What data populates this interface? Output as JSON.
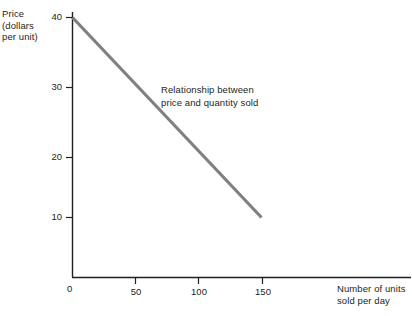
{
  "chart_data": {
    "type": "line",
    "title": "",
    "xlabel": "Number of units\nsold per day",
    "ylabel": "Price\n(dollars\nper unit)",
    "xlim": [
      0,
      180
    ],
    "ylim": [
      0,
      43
    ],
    "grid": false,
    "legend": "none",
    "annotations": [
      {
        "text": "Relationship between\nprice and quantity sold",
        "x": 95,
        "y": 29
      }
    ],
    "xticks": [
      0,
      50,
      100,
      150
    ],
    "xtick_labels": [
      "0",
      "50",
      "100",
      "150"
    ],
    "yticks": [
      10,
      20,
      30,
      40
    ],
    "ytick_labels": [
      "10",
      "20",
      "30",
      "40"
    ],
    "origin_label": "0",
    "series": [
      {
        "name": "Relationship between price and quantity sold",
        "color": "#808080",
        "x": [
          0,
          150
        ],
        "values": [
          40,
          10
        ]
      }
    ]
  },
  "style": {
    "line_color": "#808080",
    "axis_color": "#231f20",
    "text_color": "#231f20",
    "background": "#ffffff"
  }
}
